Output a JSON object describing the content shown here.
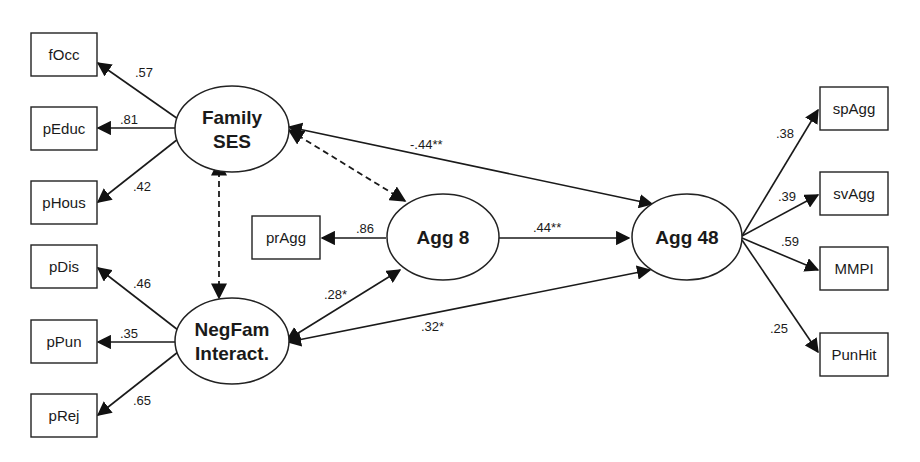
{
  "diagram": {
    "type": "structural-equation-model",
    "latent": [
      {
        "id": "famses",
        "lines": [
          "Family",
          "SES"
        ]
      },
      {
        "id": "negfam",
        "lines": [
          "NegFam",
          "Interact."
        ]
      },
      {
        "id": "agg8",
        "lines": [
          "Agg 8"
        ]
      },
      {
        "id": "agg48",
        "lines": [
          "Agg 48"
        ]
      }
    ],
    "observed": {
      "focc": "fOcc",
      "peduc": "pEduc",
      "phous": "pHous",
      "pdis": "pDis",
      "ppun": "pPun",
      "prej": "pRej",
      "pragg": "prAgg",
      "spagg": "spAgg",
      "svagg": "svAgg",
      "mmpi": "MMPI",
      "punhit": "PunHit"
    },
    "loadings": {
      "famses_focc": ".57",
      "famses_peduc": ".81",
      "famses_phous": ".42",
      "negfam_pdis": ".46",
      "negfam_ppun": ".35",
      "negfam_prej": ".65",
      "agg8_pragg": ".86",
      "agg48_spagg": ".38",
      "agg48_svagg": ".39",
      "agg48_mmpi": ".59",
      "agg48_punhit": ".25"
    },
    "paths": {
      "famses_agg48": "-.44**",
      "agg8_agg48": ".44**",
      "negfam_agg8": ".28*",
      "negfam_agg48": ".32*"
    }
  }
}
